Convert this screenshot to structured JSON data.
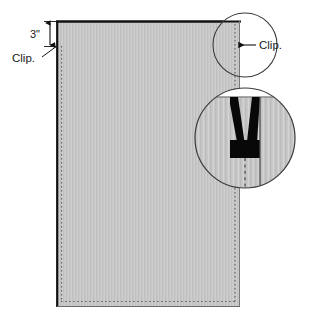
{
  "diagram": {
    "canvas": {
      "width": 320,
      "height": 322,
      "background": "#ffffff"
    },
    "colors": {
      "fabric_fill": "#c8c8c8",
      "fabric_stripe": "#bdbdbd",
      "outline": "#111111",
      "stitch": "#6e6e6e",
      "notch_black": "#080808",
      "callout_circle": "#3a3a3a",
      "text": "#1a1a1a",
      "background": "#ffffff"
    },
    "panel": {
      "name": "fabric-panel",
      "x": 57,
      "y": 21,
      "width": 183,
      "height": 286,
      "top_edge_style": "solid-heavy",
      "left_edge_style": "solid-heavy",
      "stitch_edges": [
        "left",
        "right",
        "bottom"
      ]
    },
    "dimension": {
      "label": "3\"",
      "orientation": "vertical",
      "from_y": 22,
      "to_y": 47,
      "arrowheads": "both"
    },
    "annotations": [
      {
        "id": "clip-left",
        "label": "Clip.",
        "x": 12,
        "y": 60,
        "leader_to_x": 56,
        "leader_to_y": 46,
        "arrowhead": "down"
      },
      {
        "id": "clip-right",
        "label": "Clip.",
        "x": 258,
        "y": 49,
        "leader_to_x": 240,
        "leader_to_y": 45,
        "arrowhead": "left"
      }
    ],
    "callouts": [
      {
        "id": "callout-top",
        "name": "clip-callout-circle",
        "cx": 245,
        "cy": 45,
        "r": 32,
        "describes": "clip mark on panel edge"
      },
      {
        "id": "callout-detail",
        "name": "notch-detail-circle",
        "cx": 245,
        "cy": 138,
        "r": 50,
        "describes": "magnified V-notch clip cut at panel edge"
      }
    ],
    "detail": {
      "notch_shape": "V",
      "notch_color": "#080808",
      "center_line_style": "dashed",
      "edge_line_style": "solid"
    }
  }
}
